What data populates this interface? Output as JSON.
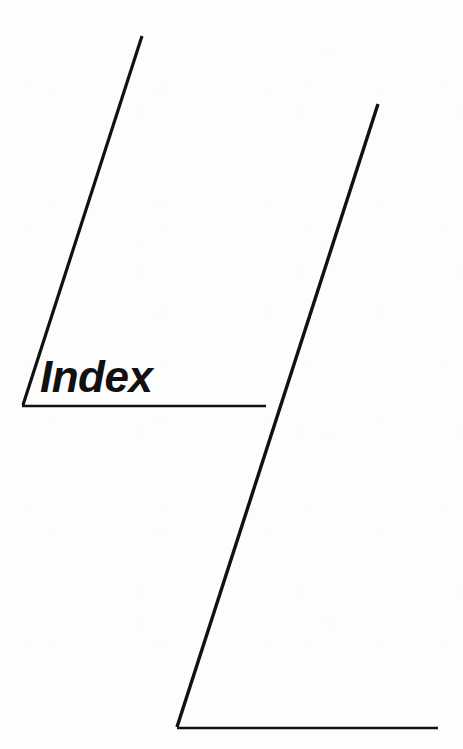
{
  "page": {
    "width": 463,
    "height": 749,
    "background_color": "#fdfdfd",
    "ink_color": "#111111",
    "title_text": "Index"
  },
  "label": {
    "text": "Index",
    "style": "bold-italic",
    "font_size_px": 44,
    "x": 40,
    "baseline_y": 396
  },
  "graphics": {
    "stroke_color": "#111111",
    "elements": [
      {
        "name": "upper-diagonal-stroke",
        "type": "line",
        "x1": 142,
        "y1": 36,
        "x2": 23,
        "y2": 405,
        "stroke_width": 3.2
      },
      {
        "name": "upper-horizontal-rule",
        "type": "line",
        "x1": 22,
        "y1": 406,
        "x2": 266,
        "y2": 406,
        "stroke_width": 2.4
      },
      {
        "name": "lower-diagonal-stroke",
        "type": "line",
        "x1": 378,
        "y1": 104,
        "x2": 177,
        "y2": 727,
        "stroke_width": 3.4
      },
      {
        "name": "lower-horizontal-rule",
        "type": "line",
        "x1": 177,
        "y1": 728,
        "x2": 438,
        "y2": 728,
        "stroke_width": 2.6
      }
    ]
  }
}
